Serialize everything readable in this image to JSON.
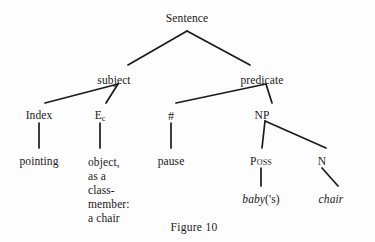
{
  "figure": {
    "caption": "Figure 10",
    "caption_x": 194,
    "caption_y": 221,
    "width": 375,
    "height": 242,
    "background_color": "#fdfdfd",
    "ink_color": "#1a1a1a"
  },
  "nodes": {
    "sentence": {
      "label": "Sentence",
      "x": 187,
      "y": 12
    },
    "subject": {
      "label": "subject",
      "x": 114,
      "y": 74
    },
    "predicate": {
      "label": "predicate",
      "x": 262,
      "y": 74
    },
    "index": {
      "label": "Index",
      "x": 39,
      "y": 109
    },
    "ec": {
      "label": "E",
      "subscript": "c",
      "x": 100,
      "y": 109
    },
    "hash": {
      "label": "#",
      "x": 171,
      "y": 109
    },
    "np": {
      "label": "NP",
      "x": 262,
      "y": 109
    },
    "pointing": {
      "label": "pointing",
      "x": 39,
      "y": 155
    },
    "object": {
      "lines": [
        "object,",
        "as a",
        "class-",
        "member:",
        "a chair"
      ],
      "x": 88,
      "y": 155
    },
    "pause": {
      "label": "pause",
      "x": 171,
      "y": 155
    },
    "poss": {
      "label": "Poss",
      "x": 261,
      "y": 155
    },
    "n": {
      "label": "N",
      "x": 322,
      "y": 155
    },
    "baby": {
      "italic_part": "baby",
      "roman_part": "('s)",
      "x": 261,
      "y": 193
    },
    "chair": {
      "label": "chair",
      "x": 331,
      "y": 193
    }
  },
  "edges": [
    {
      "name": "sentence-to-subject",
      "x1": 187,
      "y1": 31,
      "x2": 128,
      "y2": 65
    },
    {
      "name": "sentence-to-predicate",
      "x1": 187,
      "y1": 31,
      "x2": 250,
      "y2": 65
    },
    {
      "name": "subject-to-index",
      "x1": 118,
      "y1": 84,
      "x2": 45,
      "y2": 103
    },
    {
      "name": "subject-to-ec",
      "x1": 118,
      "y1": 84,
      "x2": 106,
      "y2": 103
    },
    {
      "name": "predicate-to-hash",
      "x1": 266,
      "y1": 84,
      "x2": 176,
      "y2": 103
    },
    {
      "name": "predicate-to-np",
      "x1": 266,
      "y1": 84,
      "x2": 272,
      "y2": 103
    },
    {
      "name": "index-to-pointing",
      "x1": 39,
      "y1": 123,
      "x2": 39,
      "y2": 148
    },
    {
      "name": "ec-to-object",
      "x1": 100,
      "y1": 123,
      "x2": 100,
      "y2": 148
    },
    {
      "name": "hash-to-pause",
      "x1": 171,
      "y1": 123,
      "x2": 171,
      "y2": 148
    },
    {
      "name": "np-to-poss",
      "x1": 265,
      "y1": 121,
      "x2": 262,
      "y2": 148
    },
    {
      "name": "np-to-n",
      "x1": 265,
      "y1": 121,
      "x2": 326,
      "y2": 148
    },
    {
      "name": "poss-to-baby",
      "x1": 261,
      "y1": 168,
      "x2": 261,
      "y2": 186
    },
    {
      "name": "n-to-chair",
      "x1": 322,
      "y1": 168,
      "x2": 338,
      "y2": 186
    }
  ]
}
